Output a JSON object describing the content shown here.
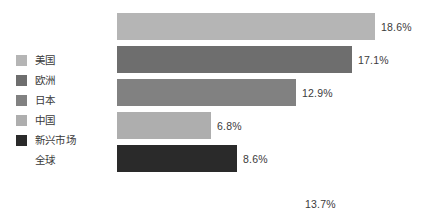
{
  "chart_data": {
    "type": "bar",
    "orientation": "horizontal",
    "title": "",
    "subtitle": "",
    "xlabel": "",
    "ylabel": "",
    "grid": false,
    "legend_position": "left",
    "categories": [
      "美国",
      "欧洲",
      "日本",
      "中国",
      "新兴市场",
      "全球"
    ],
    "values": [
      18.6,
      17.1,
      12.9,
      6.8,
      8.6,
      13.7
    ],
    "value_labels": [
      "18.6%",
      "17.1%",
      "12.9%",
      "6.8%",
      "8.6%",
      "13.7%"
    ],
    "series_colors": [
      "#b5b5b5",
      "#6e6e6e",
      "#818181",
      "#aeaeae",
      "#2a2a2a",
      "#ffffff"
    ],
    "bar_pixel_widths": [
      258,
      235,
      179,
      94,
      120,
      0
    ],
    "bar_pixel_tops": [
      0,
      33,
      66,
      99,
      132,
      177
    ],
    "bar_label_offsets": [
      0,
      0,
      0,
      0,
      0,
      188
    ]
  },
  "legend": {
    "items": [
      {
        "label": "美国",
        "color": "#b5b5b5",
        "has_swatch": true
      },
      {
        "label": "欧洲",
        "color": "#6e6e6e",
        "has_swatch": true
      },
      {
        "label": "日本",
        "color": "#818181",
        "has_swatch": true
      },
      {
        "label": "中国",
        "color": "#aeaeae",
        "has_swatch": true
      },
      {
        "label": "新兴市场",
        "color": "#2a2a2a",
        "has_swatch": true
      },
      {
        "label": "全球",
        "color": "transparent",
        "has_swatch": false
      }
    ]
  },
  "bars": [
    {
      "label": "18.6%"
    },
    {
      "label": "17.1%"
    },
    {
      "label": "12.9%"
    },
    {
      "label": "6.8%"
    },
    {
      "label": "8.6%"
    },
    {
      "label": "13.7%"
    }
  ]
}
